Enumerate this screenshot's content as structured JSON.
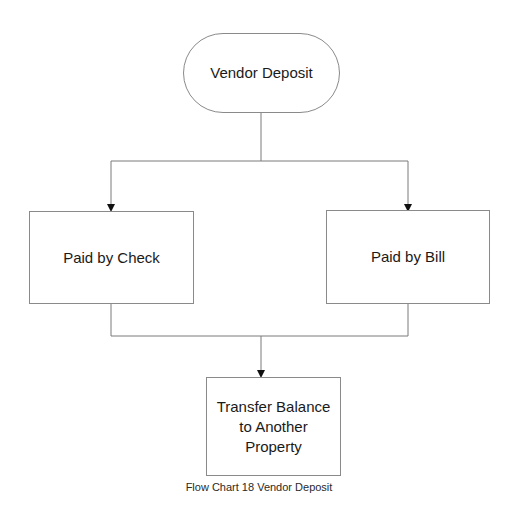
{
  "diagram": {
    "type": "flowchart",
    "nodes": [
      {
        "id": "start",
        "shape": "terminal",
        "label": "Vendor Deposit"
      },
      {
        "id": "check",
        "shape": "process",
        "label": "Paid by Check"
      },
      {
        "id": "bill",
        "shape": "process",
        "label": "Paid by Bill"
      },
      {
        "id": "transfer",
        "shape": "process",
        "label": "Transfer Balance to Another Property"
      }
    ],
    "edges": [
      {
        "from": "start",
        "to": "check"
      },
      {
        "from": "start",
        "to": "bill"
      },
      {
        "from": "check",
        "to": "transfer"
      },
      {
        "from": "bill",
        "to": "transfer"
      }
    ],
    "caption": "Flow Chart 18 Vendor Deposit"
  }
}
